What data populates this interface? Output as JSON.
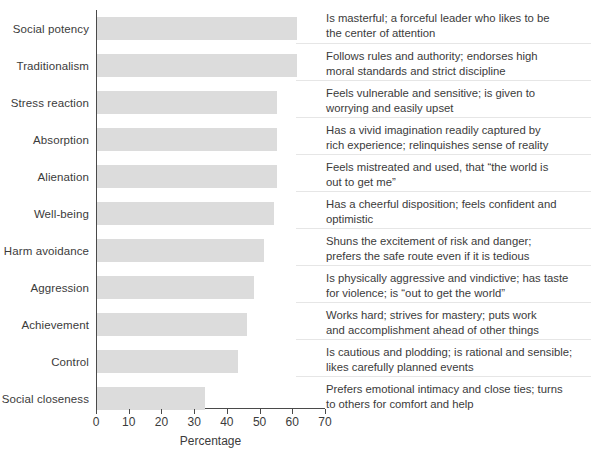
{
  "chart_data": {
    "type": "bar",
    "orientation": "horizontal",
    "title": "",
    "xlabel": "Percentage",
    "ylabel": "",
    "xlim": [
      0,
      70
    ],
    "xticks": [
      0,
      10,
      20,
      30,
      40,
      50,
      60,
      70
    ],
    "grid": false,
    "legend": null,
    "bar_color": "#dcdcdc",
    "categories": [
      "Social potency",
      "Traditionalism",
      "Stress reaction",
      "Absorption",
      "Alienation",
      "Well-being",
      "Harm avoidance",
      "Aggression",
      "Achievement",
      "Control",
      "Social closeness"
    ],
    "values": [
      61,
      61,
      55,
      55,
      55,
      54,
      51,
      48,
      46,
      43,
      33
    ],
    "annotations": [
      "Is masterful; a forceful leader who likes to be the center of attention",
      "Follows rules and authority; endorses high moral standards and strict discipline",
      "Feels vulnerable and sensitive; is given to worrying and easily upset",
      "Has a vivid imagination readily captured by rich experience; relinquishes sense of reality",
      "Feels mistreated and used, that “the world is out to get me”",
      "Has a cheerful disposition; feels confident and optimistic",
      "Shuns the excitement of risk and danger; prefers the safe route even if it is tedious",
      "Is physically aggressive and vindictive; has taste for violence; is “out to get the world”",
      "Works hard; strives for mastery; puts work and accomplishment ahead of other things",
      "Is cautious and plodding; is rational and sensible; likes carefully planned events",
      "Prefers emotional intimacy and close ties; turns to others for comfort and help"
    ]
  },
  "descriptions": [
    {
      "line1": "Is masterful; a forceful leader who likes to be",
      "line2": "the center of attention"
    },
    {
      "line1": "Follows rules and authority; endorses high",
      "line2": "moral standards and strict discipline"
    },
    {
      "line1": "Feels vulnerable and sensitive; is given to",
      "line2": "worrying and easily upset"
    },
    {
      "line1": "Has a vivid imagination readily captured by",
      "line2": "rich experience; relinquishes sense of reality"
    },
    {
      "line1": "Feels mistreated and used, that “the world is",
      "line2": "out to get me”"
    },
    {
      "line1": "Has a cheerful disposition; feels confident and",
      "line2": "optimistic"
    },
    {
      "line1": "Shuns the excitement of risk and danger;",
      "line2": "prefers the safe route even if it is tedious"
    },
    {
      "line1": "Is physically aggressive and vindictive; has taste",
      "line2": "for violence; is “out to get the world”"
    },
    {
      "line1": "Works hard; strives for mastery; puts work",
      "line2": "and accomplishment ahead of other things"
    },
    {
      "line1": "Is cautious and plodding; is rational and sensible;",
      "line2": "likes carefully planned events"
    },
    {
      "line1": "Prefers emotional intimacy and close ties; turns",
      "line2": "to others for comfort and help"
    }
  ],
  "axis": {
    "x_title": "Percentage",
    "tick_labels": [
      "0",
      "10",
      "20",
      "30",
      "40",
      "50",
      "60",
      "70"
    ]
  }
}
